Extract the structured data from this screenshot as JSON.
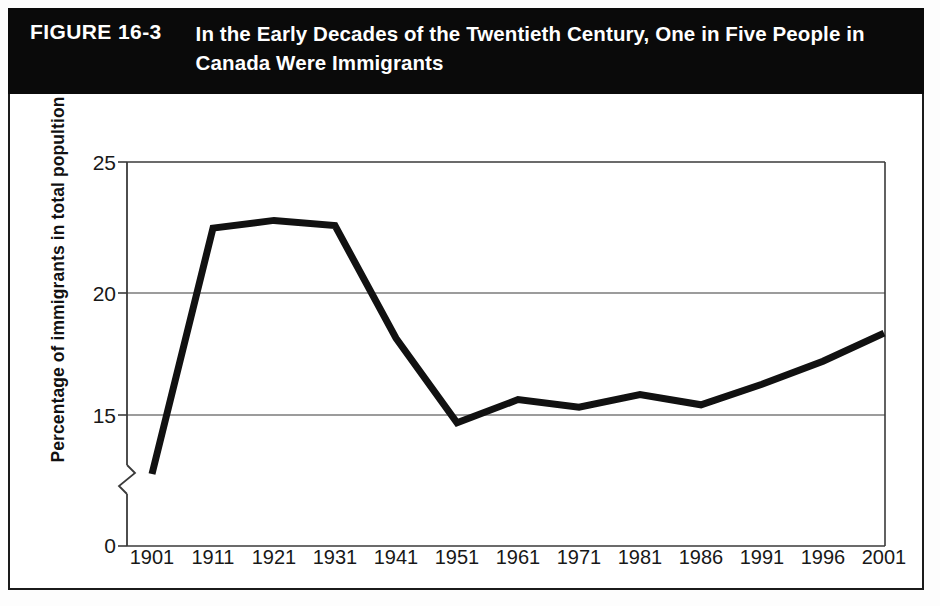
{
  "figure": {
    "number_label": "FIGURE 16-3",
    "title": "In the Early Decades of the Twentieth Century, One in Five People in Canada Were Immigrants",
    "band_color": "#0a0a0a",
    "band_text_color": "#ffffff"
  },
  "chart_data": {
    "type": "line",
    "title": "In the Early Decades of the Twentieth Century, One in Five People in Canada Were Immigrants",
    "xlabel": "",
    "ylabel": "Percentage of immigrants in total popultion",
    "categories": [
      "1901",
      "1911",
      "1921",
      "1931",
      "1941",
      "1951",
      "1961",
      "1971",
      "1981",
      "1986",
      "1991",
      "1996",
      "2001"
    ],
    "values": [
      11.0,
      22.3,
      22.6,
      22.4,
      18.0,
      14.7,
      15.6,
      15.3,
      15.8,
      15.4,
      16.2,
      17.1,
      18.2
    ],
    "series": [
      {
        "name": "Percentage of immigrants in total population",
        "values": [
          11.0,
          22.3,
          22.6,
          22.4,
          18.0,
          14.7,
          15.6,
          15.3,
          15.8,
          15.4,
          16.2,
          17.1,
          18.2
        ]
      }
    ],
    "y_ticks": [
      0,
      15,
      20,
      25
    ],
    "y_tick_labels": [
      "0",
      "15",
      "20",
      "25"
    ],
    "ylim": [
      0,
      25
    ],
    "axis_break": true,
    "axis_break_between": [
      0,
      15
    ],
    "grid": true,
    "gridlines_at": [
      15,
      20,
      25
    ],
    "legend": "none",
    "line_color": "#111111",
    "line_width_px": 7,
    "plot_background": "#ffffff",
    "note": "First point (1901) is drawn clipped at the broken-axis region near the bottom of the 15 band."
  }
}
